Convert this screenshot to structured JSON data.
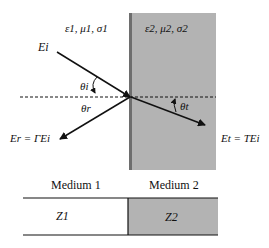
{
  "diagram": {
    "medium1": {
      "params": "ε1, μ1, σ1",
      "label": "Medium 1",
      "impedance": "Z1"
    },
    "medium2": {
      "params": "ε2, μ2, σ2",
      "label": "Medium 2",
      "impedance": "Z2"
    },
    "waves": {
      "incident": "Ei",
      "reflected": "Er = ΓEi",
      "transmitted": "Et = TEi"
    },
    "angles": {
      "incidence": "θi",
      "reflection": "θr",
      "transmission": "θt"
    },
    "colors": {
      "medium2_fill": "#b3b3b3",
      "interface_line": "#6e6e6e",
      "lines": "#111111",
      "background": "#ffffff"
    }
  }
}
